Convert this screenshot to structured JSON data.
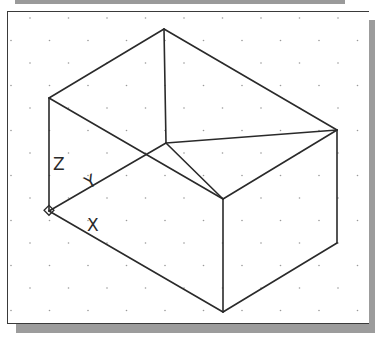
{
  "viewport": {
    "background": "#ffffff",
    "grid": {
      "spacing_x": 38.5,
      "spacing_y": 22.5,
      "dot_color": "#9a9a9a"
    },
    "line_color": "#2a2a2a"
  },
  "ucs_icon": {
    "labels": {
      "x": "X",
      "y": "Y",
      "z": "Z"
    },
    "origin": [
      49,
      211
    ]
  },
  "box": {
    "vertices": {
      "back_top": [
        164,
        29
      ],
      "left_top": [
        49,
        98
      ],
      "right_top": [
        337,
        130
      ],
      "front_top": [
        223,
        199
      ],
      "back_bottom": [
        166,
        143
      ],
      "left_bottom": [
        49,
        211
      ],
      "right_bottom": [
        337,
        243
      ],
      "front_bottom": [
        223,
        312
      ]
    }
  }
}
